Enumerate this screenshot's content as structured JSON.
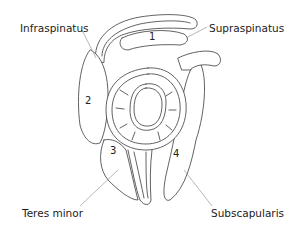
{
  "diagram": {
    "labels": {
      "infraspinatus": "Infraspinatus",
      "supraspinatus": "Supraspinatus",
      "teres_minor": "Teres minor",
      "subscapularis": "Subscapularis"
    },
    "numbers": {
      "supraspinatus": "1",
      "infraspinatus": "2",
      "teres_minor": "3",
      "subscapularis": "4"
    }
  }
}
